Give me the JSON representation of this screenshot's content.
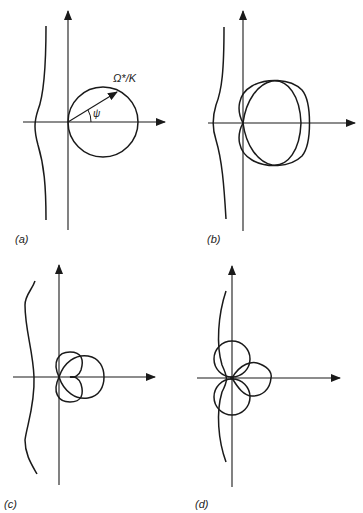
{
  "figure": {
    "panels": [
      {
        "id": "a",
        "label": "(a)",
        "annotation_radius": "Ω*/K",
        "annotation_angle": "ψ"
      },
      {
        "id": "b",
        "label": "(b)"
      },
      {
        "id": "c",
        "label": "(c)"
      },
      {
        "id": "d",
        "label": "(d)"
      }
    ],
    "stroke_color": "#1a1a1a"
  }
}
